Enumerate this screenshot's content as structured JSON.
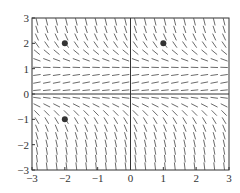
{
  "chart_data": {
    "type": "scatter",
    "subtype": "slope_field",
    "equation": "dy/dx = y(1 - y)",
    "title": "",
    "xlabel": "",
    "ylabel": "",
    "xlim": [
      -3,
      3
    ],
    "ylim": [
      -3,
      3
    ],
    "x_ticks": [
      -3,
      -2,
      -1,
      0,
      1,
      2,
      3
    ],
    "y_ticks": [
      -3,
      -2,
      -1,
      0,
      1,
      2,
      3
    ],
    "x_tick_labels": [
      "−3",
      "−2",
      "−1",
      "0",
      "1",
      "2",
      "3"
    ],
    "y_tick_labels": [
      "−3",
      "−2",
      "−1",
      "0",
      "1",
      "2",
      "3"
    ],
    "grid": false,
    "field_step": 0.3,
    "points": [
      {
        "x": -2,
        "y": 2
      },
      {
        "x": 1,
        "y": 2
      },
      {
        "x": -2,
        "y": -1
      }
    ],
    "colors": {
      "segment": "#444444",
      "axis": "#333333",
      "point": "#333333"
    }
  }
}
